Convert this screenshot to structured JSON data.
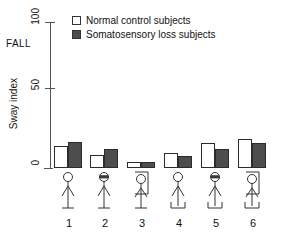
{
  "figure": {
    "fall_label": "FALL",
    "axis_title": "Sway index"
  },
  "legend": {
    "items": [
      {
        "label": "Normal control subjects",
        "swatch": "white-square-icon",
        "color": "#ffffff"
      },
      {
        "label": "Somatosensory loss subjects",
        "swatch": "dark-square-icon",
        "color": "#4d4d4d"
      }
    ]
  },
  "conditions": [
    {
      "id": "1",
      "figure": "stick-figure-eyes-open-fixed-support"
    },
    {
      "id": "2",
      "figure": "stick-figure-eyes-closed-fixed-support"
    },
    {
      "id": "3",
      "figure": "stick-figure-sway-referenced-vision-fixed-support"
    },
    {
      "id": "4",
      "figure": "stick-figure-eyes-open-sway-referenced-support"
    },
    {
      "id": "5",
      "figure": "stick-figure-eyes-closed-sway-referenced-support"
    },
    {
      "id": "6",
      "figure": "stick-figure-sway-referenced-vision-and-support"
    }
  ],
  "chart_data": {
    "type": "bar",
    "title": "",
    "xlabel": "",
    "ylabel": "Sway index",
    "categories": [
      "1",
      "2",
      "3",
      "4",
      "5",
      "6"
    ],
    "ylim": [
      0,
      100
    ],
    "yticks": [
      0,
      50,
      100
    ],
    "ytick_labels": [
      "0",
      "50",
      "100"
    ],
    "grid": false,
    "legend_position": "top-left",
    "annotations": [
      {
        "text": "FALL",
        "y": 75,
        "axis": "y"
      }
    ],
    "series": [
      {
        "name": "Normal control subjects",
        "color": "#ffffff",
        "values": [
          15,
          9,
          4,
          10,
          17,
          20
        ]
      },
      {
        "name": "Somatosensory loss subjects",
        "color": "#4d4d4d",
        "values": [
          18,
          13,
          4,
          8,
          13,
          17
        ]
      }
    ]
  }
}
